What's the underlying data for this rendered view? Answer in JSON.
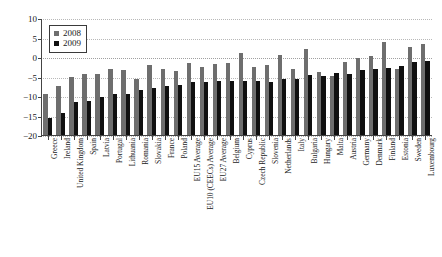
{
  "chart_data": {
    "type": "bar",
    "title": "",
    "subtitle": "",
    "xlabel": "",
    "ylabel": "",
    "ylim": [
      -20,
      10
    ],
    "yticks": [
      10,
      5,
      0,
      -5,
      -10,
      -15,
      -20
    ],
    "ytick_labels": [
      "10",
      "5",
      "0",
      "−5",
      "−10",
      "−15",
      "−20"
    ],
    "grid": true,
    "legend_position": "top-left",
    "categories": [
      "Greece",
      "Ireland",
      "United Kingdom",
      "Spain",
      "Latvia",
      "Portugal",
      "Lithuania",
      "Romania",
      "Slovakia",
      "France",
      "Poland",
      "EU15 Average",
      "EU10 (CEECs) Average",
      "EU27 Average",
      "Belgium",
      "Cyprus",
      "Czech Republic",
      "Slovenia",
      "Netherlands",
      "Italy",
      "Bulgaria",
      "Hungary",
      "Malta",
      "Austria",
      "Germany",
      "Denmark",
      "Finland",
      "Estonia",
      "Sweden",
      "Luxembourg"
    ],
    "series": [
      {
        "name": "2008",
        "color": "#6e6e6e",
        "values": [
          -9.3,
          -7.2,
          -4.9,
          -4.1,
          -4.0,
          -2.7,
          -3.0,
          -5.4,
          -1.8,
          -2.9,
          -3.4,
          -1.2,
          -2.4,
          -1.6,
          -1.3,
          1.3,
          -2.4,
          -1.8,
          0.9,
          -2.7,
          2.2,
          -3.7,
          -4.5,
          -1.0,
          -0.1,
          0.6,
          4.0,
          -2.7,
          2.9,
          3.7
        ]
      },
      {
        "name": "2009",
        "color": "#101010",
        "values": [
          -15.3,
          -14.2,
          -11.4,
          -11.0,
          -10.0,
          -9.1,
          -9.1,
          -8.3,
          -7.6,
          -7.2,
          -6.9,
          -6.2,
          -6.1,
          -6.0,
          -5.9,
          -6.0,
          -5.8,
          -6.2,
          -5.5,
          -5.3,
          -4.3,
          -4.5,
          -3.8,
          -4.1,
          -3.1,
          -2.8,
          -2.6,
          -2.0,
          -0.9,
          -0.7
        ]
      }
    ]
  },
  "legend": {
    "entries": [
      {
        "label": "2008",
        "color": "#6e6e6e"
      },
      {
        "label": "2009",
        "color": "#101010"
      }
    ]
  }
}
